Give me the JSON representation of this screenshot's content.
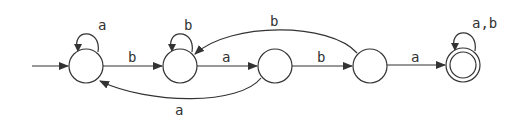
{
  "diagram": {
    "type": "finite-automaton",
    "states": [
      {
        "id": "q0",
        "label": "",
        "cx": 86,
        "cy": 66,
        "start": true,
        "accepting": false
      },
      {
        "id": "q1",
        "label": "",
        "cx": 180,
        "cy": 66,
        "start": false,
        "accepting": false
      },
      {
        "id": "q2",
        "label": "",
        "cx": 275,
        "cy": 66,
        "start": false,
        "accepting": false
      },
      {
        "id": "q3",
        "label": "",
        "cx": 370,
        "cy": 66,
        "start": false,
        "accepting": false
      },
      {
        "id": "q4",
        "label": "",
        "cx": 463,
        "cy": 65,
        "start": false,
        "accepting": true
      }
    ],
    "transitions": [
      {
        "from": "q0",
        "to": "q0",
        "label": "a"
      },
      {
        "from": "q0",
        "to": "q1",
        "label": "b"
      },
      {
        "from": "q1",
        "to": "q1",
        "label": "b"
      },
      {
        "from": "q1",
        "to": "q2",
        "label": "a"
      },
      {
        "from": "q2",
        "to": "q0",
        "label": "a"
      },
      {
        "from": "q2",
        "to": "q3",
        "label": "b"
      },
      {
        "from": "q3",
        "to": "q1",
        "label": "b"
      },
      {
        "from": "q3",
        "to": "q4",
        "label": "a"
      },
      {
        "from": "q4",
        "to": "q4",
        "label": "a,b"
      }
    ],
    "colors": {
      "stroke": "#333333",
      "background": "#ffffff"
    }
  }
}
